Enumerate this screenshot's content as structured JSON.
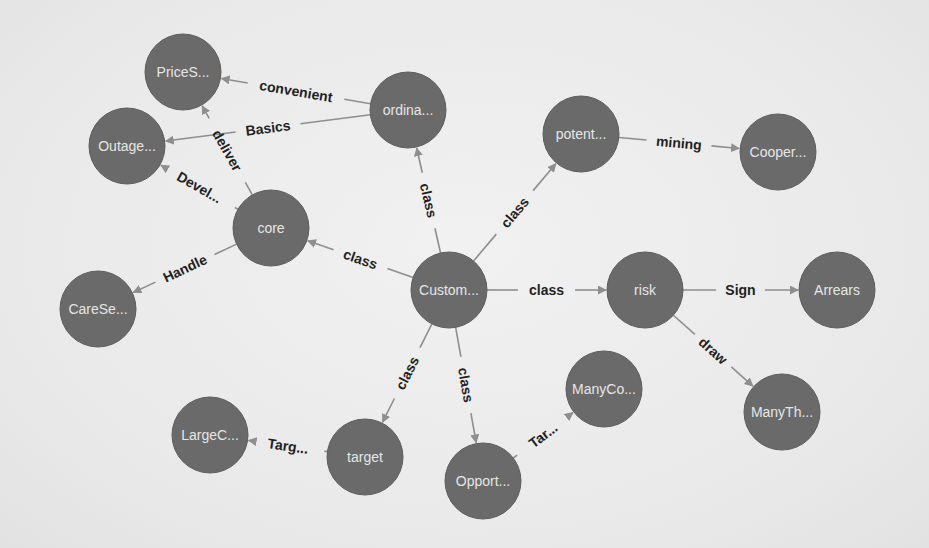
{
  "diagram": {
    "type": "knowledge-graph",
    "colors": {
      "node_fill": "#6a6a6a",
      "node_text": "#e6e6e6",
      "edge": "#8e8e8e",
      "edge_label": "#1f1f1f",
      "background": "#ececec"
    },
    "node_radius": 38,
    "nodes": [
      {
        "id": "prices",
        "label": "PriceS...",
        "x": 183,
        "y": 72
      },
      {
        "id": "outage",
        "label": "Outage...",
        "x": 127,
        "y": 146
      },
      {
        "id": "ordina",
        "label": "ordina...",
        "x": 408,
        "y": 110
      },
      {
        "id": "core",
        "label": "core",
        "x": 271,
        "y": 228
      },
      {
        "id": "carese",
        "label": "CareSe...",
        "x": 98,
        "y": 309
      },
      {
        "id": "potent",
        "label": "potent...",
        "x": 581,
        "y": 134
      },
      {
        "id": "cooper",
        "label": "Cooper...",
        "x": 778,
        "y": 152
      },
      {
        "id": "custom",
        "label": "Custom...",
        "x": 449,
        "y": 290
      },
      {
        "id": "risk",
        "label": "risk",
        "x": 645,
        "y": 290
      },
      {
        "id": "arrears",
        "label": "Arrears",
        "x": 837,
        "y": 290
      },
      {
        "id": "manyth",
        "label": "ManyTh...",
        "x": 782,
        "y": 412
      },
      {
        "id": "manyco",
        "label": "ManyCo...",
        "x": 604,
        "y": 389
      },
      {
        "id": "largec",
        "label": "LargeC...",
        "x": 210,
        "y": 435
      },
      {
        "id": "target",
        "label": "target",
        "x": 365,
        "y": 457
      },
      {
        "id": "opport",
        "label": "Opport...",
        "x": 483,
        "y": 481
      }
    ],
    "edges": [
      {
        "from": "ordina",
        "to": "prices",
        "label": "convenient"
      },
      {
        "from": "ordina",
        "to": "outage",
        "label": "Basics"
      },
      {
        "from": "core",
        "to": "prices",
        "label": "deliver"
      },
      {
        "from": "core",
        "to": "outage",
        "label": "Devel..."
      },
      {
        "from": "core",
        "to": "carese",
        "label": "Handle"
      },
      {
        "from": "custom",
        "to": "core",
        "label": "class"
      },
      {
        "from": "custom",
        "to": "ordina",
        "label": "class"
      },
      {
        "from": "custom",
        "to": "potent",
        "label": "class"
      },
      {
        "from": "potent",
        "to": "cooper",
        "label": "mining"
      },
      {
        "from": "custom",
        "to": "risk",
        "label": "class"
      },
      {
        "from": "risk",
        "to": "arrears",
        "label": "Sign"
      },
      {
        "from": "risk",
        "to": "manyth",
        "label": "draw"
      },
      {
        "from": "custom",
        "to": "target",
        "label": "class"
      },
      {
        "from": "custom",
        "to": "opport",
        "label": "class"
      },
      {
        "from": "target",
        "to": "largec",
        "label": "Targ..."
      },
      {
        "from": "opport",
        "to": "manyco",
        "label": "Tar..."
      }
    ]
  }
}
